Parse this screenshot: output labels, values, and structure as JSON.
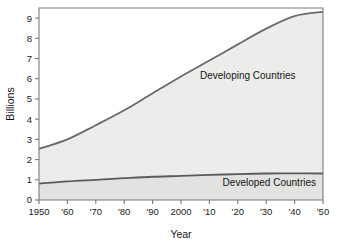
{
  "chart_data": {
    "type": "area",
    "stacked": true,
    "title": "",
    "xlabel": "Year",
    "ylabel": "Billions",
    "xlim": [
      1950,
      2050
    ],
    "ylim": [
      0,
      9.5
    ],
    "grid": false,
    "legend_position": "inline-annotations",
    "x": [
      1950,
      1960,
      1970,
      1980,
      1990,
      2000,
      2010,
      2020,
      2030,
      2040,
      2050
    ],
    "xtick_labels": [
      "1950",
      "'60",
      "'70",
      "'80",
      "'90",
      "2000",
      "'10",
      "'20",
      "'30",
      "'40",
      "'50"
    ],
    "ytick_labels": [
      "0",
      "1",
      "2",
      "3",
      "4",
      "5",
      "6",
      "7",
      "8",
      "9"
    ],
    "ytick_values": [
      0,
      1,
      2,
      3,
      4,
      5,
      6,
      7,
      8,
      9
    ],
    "series": [
      {
        "name": "Developed Countries",
        "values": [
          0.81,
          0.92,
          1.0,
          1.08,
          1.15,
          1.19,
          1.24,
          1.28,
          1.31,
          1.32,
          1.31
        ],
        "fill": "#e2e2e1",
        "line": "#5a5a5a"
      },
      {
        "name": "Developing Countries",
        "values": [
          1.72,
          2.08,
          2.7,
          3.36,
          4.13,
          4.92,
          5.66,
          6.42,
          7.17,
          7.78,
          8.0
        ],
        "fill": "#ececeb",
        "line": "#6a6a6a"
      }
    ],
    "cumulative_total": [
      2.53,
      3.0,
      3.7,
      4.44,
      5.28,
      6.11,
      6.9,
      7.7,
      8.48,
      9.1,
      9.31
    ],
    "annotations": [
      {
        "text": "Developing Countries",
        "x": 2014,
        "y": 6.15
      },
      {
        "text": "Developed Countries",
        "x": 2036,
        "y": 0.72
      }
    ]
  },
  "axes": {
    "y_title": "Billions",
    "x_title": "Year"
  }
}
